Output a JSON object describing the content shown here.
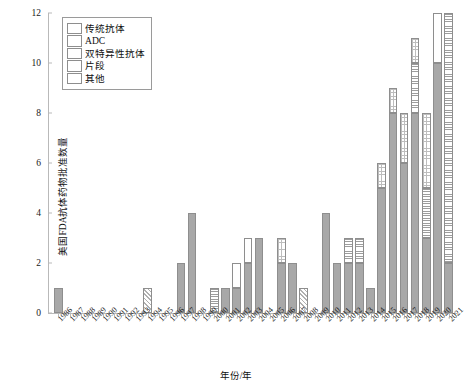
{
  "chart_data": {
    "type": "bar",
    "stacked": true,
    "title": "",
    "xlabel": "年份/年",
    "ylabel": "美国FDA抗体药物批准数量",
    "ylim": [
      0,
      12
    ],
    "yticks": [
      0,
      2,
      4,
      6,
      8,
      10,
      12
    ],
    "ytick_labels": [
      "0",
      "2",
      "4",
      "6",
      "8",
      "10",
      "12"
    ],
    "grid": false,
    "legend_position": "upper-left-inside",
    "categories": [
      "1986",
      "1987",
      "1988",
      "1989",
      "1990",
      "1991",
      "1992",
      "1993",
      "1994",
      "1995",
      "1996",
      "1997",
      "1998",
      "1999",
      "2000",
      "2001",
      "2002",
      "2003",
      "2004",
      "2005",
      "2006",
      "2007",
      "2008",
      "2009",
      "2010",
      "2011",
      "2012",
      "2013",
      "2014",
      "2015",
      "2016",
      "2017",
      "2018",
      "2019",
      "2020",
      "2021"
    ],
    "series": [
      {
        "name": "传统抗体",
        "key": "conventional",
        "pattern": "solid",
        "values": [
          1,
          0,
          0,
          0,
          0,
          0,
          0,
          0,
          0,
          0,
          0,
          2,
          4,
          0,
          0,
          1,
          1,
          2,
          3,
          0,
          2,
          2,
          0,
          0,
          4,
          2,
          2,
          2,
          1,
          5,
          8,
          6,
          8,
          3,
          10,
          2
        ]
      },
      {
        "name": "ADC",
        "key": "adc",
        "pattern": "horizontal-lines",
        "values": [
          0,
          0,
          0,
          0,
          0,
          0,
          0,
          0,
          0,
          0,
          0,
          0,
          0,
          0,
          1,
          0,
          0,
          0,
          0,
          0,
          0,
          0,
          0,
          0,
          0,
          0,
          1,
          1,
          0,
          0,
          0,
          0,
          2,
          2,
          0,
          10
        ]
      },
      {
        "name": "双特异性抗体",
        "key": "bispecific",
        "pattern": "dotted",
        "values": [
          0,
          0,
          0,
          0,
          0,
          0,
          0,
          0,
          0,
          0,
          0,
          0,
          0,
          0,
          0,
          0,
          0,
          0,
          0,
          0,
          1,
          0,
          0,
          0,
          0,
          0,
          0,
          0,
          0,
          1,
          1,
          2,
          1,
          3,
          0,
          0
        ]
      },
      {
        "name": "片段",
        "key": "fragment",
        "pattern": "diagonal-hatch",
        "values": [
          0,
          0,
          0,
          0,
          0,
          0,
          0,
          0,
          1,
          0,
          0,
          0,
          0,
          0,
          0,
          0,
          0,
          0,
          0,
          0,
          0,
          0,
          1,
          0,
          0,
          0,
          0,
          0,
          0,
          0,
          0,
          0,
          0,
          0,
          0,
          0
        ]
      },
      {
        "name": "其他",
        "key": "other",
        "pattern": "white",
        "values": [
          0,
          0,
          0,
          0,
          0,
          0,
          0,
          0,
          0,
          0,
          0,
          0,
          0,
          0,
          0,
          0,
          1,
          1,
          0,
          0,
          0,
          0,
          0,
          0,
          0,
          0,
          0,
          0,
          0,
          0,
          0,
          0,
          0,
          0,
          2,
          0
        ]
      }
    ],
    "totals": [
      1,
      0,
      0,
      0,
      0,
      0,
      0,
      0,
      1,
      0,
      0,
      2,
      4,
      0,
      1,
      1,
      2,
      3,
      3,
      0,
      3,
      2,
      1,
      0,
      4,
      2,
      3,
      3,
      1,
      6,
      9,
      8,
      11,
      8,
      12,
      12
    ]
  },
  "legend": {
    "items": [
      {
        "label": "传统抗体",
        "swatch": "solid-gray-swatch"
      },
      {
        "label": "ADC",
        "swatch": "horizontal-line-swatch"
      },
      {
        "label": "双特异性抗体",
        "swatch": "dotted-swatch"
      },
      {
        "label": "片段",
        "swatch": "diagonal-hatch-swatch"
      },
      {
        "label": "其他",
        "swatch": "white-swatch"
      }
    ]
  },
  "colors": {
    "bar_fill": "#a8a8a8",
    "bar_edge": "#8e8e8e",
    "axis": "#b9b9b9",
    "text": "#111111",
    "background": "#ffffff"
  }
}
